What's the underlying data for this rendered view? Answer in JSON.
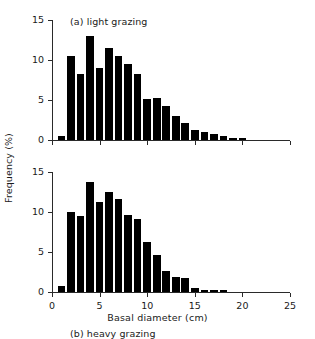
{
  "figure": {
    "xlabel": "Basal diameter (cm)",
    "ylabel": "Frequency (%)",
    "bar_color": "#000000",
    "axis_color": "#2a2a2a"
  },
  "chart_data": [
    {
      "type": "bar",
      "title": "(a) light grazing",
      "panel": "a",
      "xlabel": "Basal diameter (cm)",
      "ylabel": "Frequency (%)",
      "xlim": [
        0,
        25
      ],
      "ylim": [
        0,
        15
      ],
      "xticks": [
        0,
        5,
        10,
        15,
        20,
        25
      ],
      "xtick_labels": [
        "0",
        "5",
        "10",
        "15",
        "20",
        "25"
      ],
      "yticks": [
        0,
        5,
        10,
        15
      ],
      "ytick_labels": [
        "0",
        "5",
        "10",
        "15"
      ],
      "grid": false,
      "legend": "none",
      "bar_width": 0.8,
      "categories": [
        1,
        2,
        3,
        4,
        5,
        6,
        7,
        8,
        9,
        10,
        11,
        12,
        13,
        14,
        15,
        16,
        17,
        18,
        19,
        20
      ],
      "values": [
        0.5,
        10.5,
        8.2,
        13.0,
        9.0,
        11.5,
        10.5,
        9.5,
        8.2,
        5.1,
        5.3,
        4.3,
        3.0,
        2.1,
        1.3,
        1.0,
        0.8,
        0.5,
        0.3,
        0.3
      ]
    },
    {
      "type": "bar",
      "title": "(b) heavy grazing",
      "panel": "b",
      "xlabel": "Basal diameter (cm)",
      "ylabel": "Frequency (%)",
      "xlim": [
        0,
        25
      ],
      "ylim": [
        0,
        15
      ],
      "xticks": [
        0,
        5,
        10,
        15,
        20,
        25
      ],
      "xtick_labels": [
        "0",
        "5",
        "10",
        "15",
        "20",
        "25"
      ],
      "yticks": [
        0,
        5,
        10,
        15
      ],
      "ytick_labels": [
        "0",
        "5",
        "10",
        "15"
      ],
      "grid": false,
      "legend": "none",
      "bar_width": 0.8,
      "categories": [
        1,
        2,
        3,
        4,
        5,
        6,
        7,
        8,
        9,
        10,
        11,
        12,
        13,
        14,
        15,
        16,
        17,
        18
      ],
      "values": [
        0.8,
        10.0,
        9.5,
        13.8,
        11.3,
        12.5,
        11.6,
        9.6,
        9.1,
        6.3,
        4.6,
        2.6,
        1.9,
        1.7,
        0.5,
        0.3,
        0.3,
        0.3
      ]
    }
  ]
}
